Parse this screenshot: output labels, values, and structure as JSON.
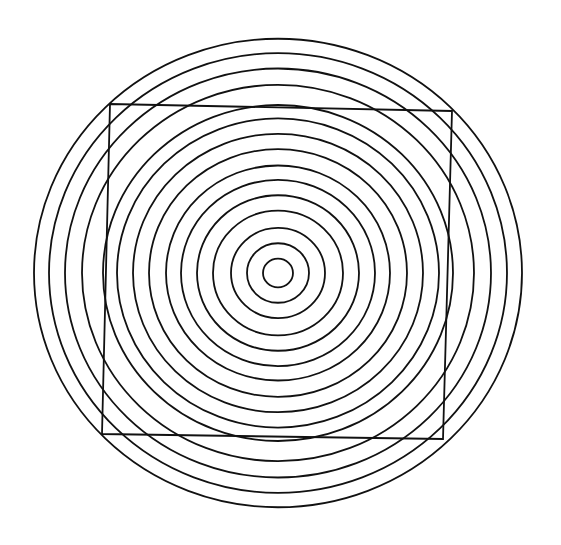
{
  "diagram": {
    "background": "#ffffff",
    "stroke_color": "#111111",
    "center": [
      278,
      273
    ],
    "aspect_y_scale": 0.96,
    "circle_radii": [
      15,
      31,
      47,
      65,
      81,
      97,
      112,
      129,
      145,
      161,
      175,
      196,
      213,
      229,
      244
    ],
    "square_corners": [
      [
        110,
        104
      ],
      [
        452,
        111
      ],
      [
        443,
        439
      ],
      [
        102,
        434
      ]
    ]
  }
}
